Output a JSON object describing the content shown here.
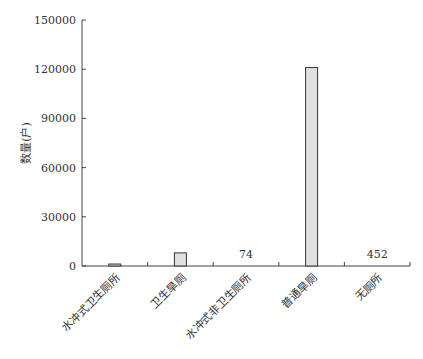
{
  "chart_data": {
    "type": "bar",
    "title": "",
    "xlabel": "",
    "ylabel": "数量(户)",
    "ylim": [
      0,
      150000
    ],
    "yticks": [
      0,
      30000,
      60000,
      90000,
      120000,
      150000
    ],
    "grid": false,
    "categories": [
      "水冲式卫生厕所",
      "卫生旱厕",
      "水冲式非卫生厕所",
      "普通旱厕",
      "无厕所"
    ],
    "values": [
      1200,
      8000,
      74,
      121000,
      452
    ],
    "data_labels": [
      "",
      "",
      "74",
      "",
      "452"
    ],
    "bar_color": "#e0e0e0",
    "bar_edge_color": "#333333"
  }
}
